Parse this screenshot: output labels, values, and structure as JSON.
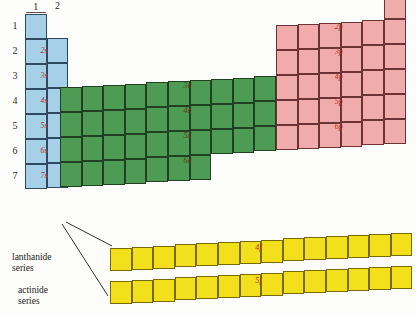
{
  "figure": {
    "type": "periodic-table-block-diagram"
  },
  "colors": {
    "s_block": "#a6cfe8",
    "d_block": "#4e9b55",
    "p_block": "#efacab",
    "f_block": "#f3e01c",
    "label_red": "#b33228",
    "text": "#1c1c1c"
  },
  "column_headers": {
    "s": [
      "1",
      "2"
    ],
    "p": [
      "3",
      "4",
      "5",
      "6",
      "7",
      "8"
    ]
  },
  "row_numbers": [
    "1",
    "2",
    "3",
    "4",
    "5",
    "6",
    "7"
  ],
  "blocks": {
    "s": {
      "name": "s-block",
      "columns": 2,
      "rows": 7,
      "labels": [
        "2s",
        "3s",
        "4s",
        "5s",
        "6s",
        "7s"
      ]
    },
    "d": {
      "name": "d-block",
      "columns": 10,
      "rows": 4,
      "labels": [
        "3d",
        "4d",
        "5d",
        "6d"
      ]
    },
    "p": {
      "name": "p-block",
      "columns": 6,
      "rows": 5,
      "labels": [
        "2p",
        "3p",
        "4p",
        "5p",
        "6p"
      ],
      "helium_cell": true
    },
    "f": {
      "name": "f-block",
      "columns": 14,
      "rows": 2,
      "labels": [
        "4f",
        "5f"
      ],
      "row_numbers": [
        "6",
        "7"
      ],
      "series": [
        {
          "line1": "lanthanide",
          "line2": "series",
          "label": "4f",
          "row": "6"
        },
        {
          "line1": "actinide",
          "line2": "series",
          "label": "5f",
          "row": "7"
        }
      ]
    }
  }
}
